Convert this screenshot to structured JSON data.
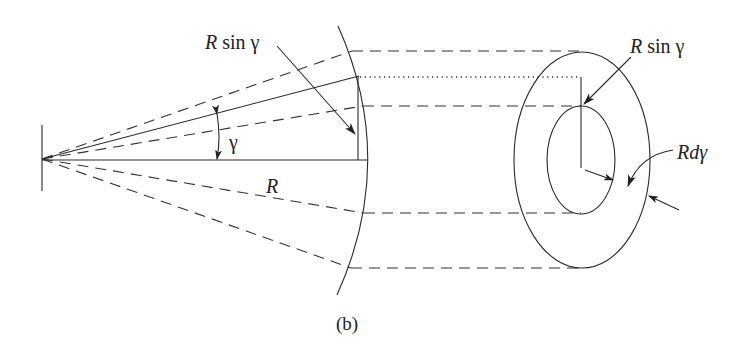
{
  "figure": {
    "caption": "(b)",
    "labels": {
      "left_rsin_R": "R",
      "left_rsin_rest": " sin γ",
      "angle": "γ",
      "radius": "R",
      "right_rsin_R": "R",
      "right_rsin_rest": " sin γ",
      "rdg_R": "R",
      "rdg_rest": "dγ"
    },
    "colors": {
      "stroke": "#2a2a2a",
      "background": "#ffffff"
    }
  }
}
